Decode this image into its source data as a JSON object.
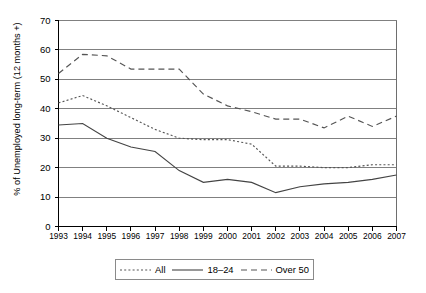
{
  "chart_data": {
    "type": "line",
    "title": "",
    "xlabel": "",
    "ylabel": "% of Unemployed long-term (12 months +)",
    "categories": [
      "1993",
      "1994",
      "1995",
      "1996",
      "1997",
      "1998",
      "1999",
      "2000",
      "2001",
      "2002",
      "2003",
      "2004",
      "2005",
      "2006",
      "2007"
    ],
    "ylim": [
      0,
      70
    ],
    "ytick_values": [
      0,
      10,
      20,
      30,
      40,
      50,
      60,
      70
    ],
    "grid": "horizontal",
    "legend_position": "bottom",
    "series": [
      {
        "name": "All",
        "style": "dotted",
        "color": "#555555",
        "values": [
          42.0,
          44.5,
          41.0,
          37.0,
          33.0,
          30.0,
          29.5,
          29.5,
          28.0,
          20.5,
          20.5,
          20.0,
          20.0,
          21.0,
          21.0
        ]
      },
      {
        "name": "18–24",
        "style": "solid",
        "color": "#444444",
        "values": [
          34.5,
          35.0,
          30.0,
          27.0,
          25.5,
          19.0,
          15.0,
          16.0,
          15.0,
          11.5,
          13.5,
          14.5,
          15.0,
          16.0,
          17.5
        ]
      },
      {
        "name": "Over 50",
        "style": "dashed",
        "color": "#555555",
        "values": [
          52.0,
          58.5,
          58.0,
          53.5,
          53.5,
          53.5,
          45.0,
          41.0,
          39.0,
          36.5,
          36.5,
          33.5,
          37.5,
          34.0,
          37.5
        ]
      }
    ]
  },
  "legend": {
    "items": [
      {
        "label": "All"
      },
      {
        "label": "18–24"
      },
      {
        "label": "Over 50"
      }
    ]
  },
  "axes": {
    "y_title": "% of Unemployed long-term (12 months +)",
    "y_ticks": [
      "0",
      "10",
      "20",
      "30",
      "40",
      "50",
      "60",
      "70"
    ],
    "x_ticks": [
      "1993",
      "1994",
      "1995",
      "1996",
      "1997",
      "1998",
      "1999",
      "2000",
      "2001",
      "2002",
      "2003",
      "2004",
      "2005",
      "2006",
      "2007"
    ]
  },
  "colors": {
    "axis": "#000000",
    "grid": "#808080",
    "plot_border": "#6e6e6e",
    "background": "#ffffff"
  }
}
